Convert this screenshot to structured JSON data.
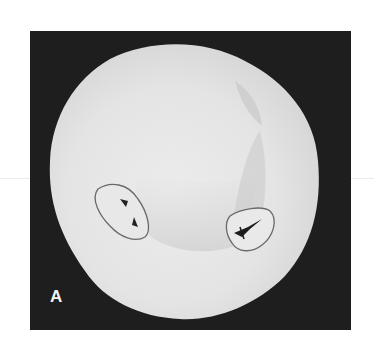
{
  "figure": {
    "panel_label": "A",
    "colors": {
      "background": "#1e1e1e",
      "tooth": "#e6e6e6",
      "outline": "#6a6a6a",
      "fissure": "#222222",
      "label": "#f4f4f4"
    },
    "annotations": [
      {
        "name": "left-outlined-fissure-region"
      },
      {
        "name": "right-outlined-fissure-region"
      }
    ]
  }
}
